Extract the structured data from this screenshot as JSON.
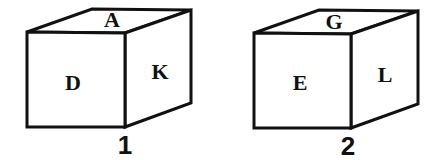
{
  "diagram": {
    "title": "",
    "cubes": [
      {
        "number": "1",
        "faces": {
          "top": "A",
          "front": "D",
          "right": "K"
        }
      },
      {
        "number": "2",
        "faces": {
          "top": "G",
          "front": "E",
          "right": "L"
        }
      }
    ],
    "colors": {
      "stroke": "#111111",
      "fill": "#ffffff"
    }
  }
}
